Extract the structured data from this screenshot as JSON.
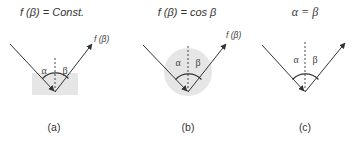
{
  "panels": [
    {
      "id": "a",
      "title": "f (β) = Const.",
      "alpha_label": "α",
      "beta_label": "β",
      "reflected_label": "f (β)",
      "caption": "(a)",
      "distribution": "rectangle"
    },
    {
      "id": "b",
      "title": "f (β) = cos β",
      "alpha_label": "α",
      "beta_label": "β",
      "reflected_label": "f (β)",
      "caption": "(b)",
      "distribution": "circle"
    },
    {
      "id": "c",
      "title": "α = β",
      "alpha_label": "α",
      "beta_label": "β",
      "reflected_label": "",
      "caption": "(c)",
      "distribution": "none"
    }
  ],
  "colors": {
    "line": "#333333",
    "distribution_fill": "#e6e6e6"
  }
}
